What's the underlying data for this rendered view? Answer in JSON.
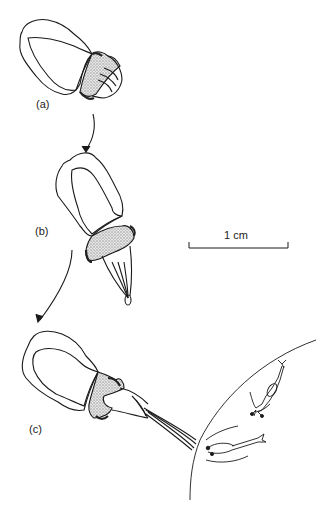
{
  "panels": [
    {
      "id": "a",
      "label": "(a)"
    },
    {
      "id": "b",
      "label": "(b)"
    },
    {
      "id": "c",
      "label": "(c)"
    }
  ],
  "scale_bar": {
    "label": "1 cm"
  },
  "colors": {
    "ink": "#1a1a1a",
    "stipple": "#c8c8c8",
    "dark": "#333333"
  }
}
